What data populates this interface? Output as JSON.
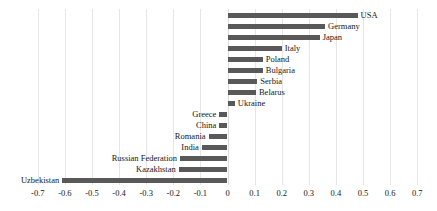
{
  "chart_data": {
    "type": "bar",
    "orientation": "horizontal",
    "title": "",
    "xlabel": "",
    "ylabel": "",
    "xlim": [
      -0.7,
      0.7
    ],
    "xticks": [
      "-0.7",
      "-0.6",
      "-0.5",
      "-0.4",
      "-0.3",
      "-0.2",
      "-0.1",
      "0",
      "0.1",
      "0.2",
      "0.3",
      "0.4",
      "0.5",
      "0.6",
      "0.7"
    ],
    "xtick_values": [
      -0.7,
      -0.6,
      -0.5,
      -0.4,
      -0.3,
      -0.2,
      -0.1,
      0,
      0.1,
      0.2,
      0.3,
      0.4,
      0.5,
      0.6,
      0.7
    ],
    "grid": true,
    "legend": "none",
    "bar_color": "#595959",
    "categories": [
      "USA",
      "Germany",
      "Japan",
      "Italy",
      "Poland",
      "Bulgaria",
      "Serbia",
      "Belarus",
      "Ukraine",
      "Greece",
      "China",
      "Romania",
      "India",
      "Russian Federation",
      "Kazakhstan",
      "Uzbekistan"
    ],
    "values": [
      0.48,
      0.36,
      0.34,
      0.2,
      0.13,
      0.13,
      0.11,
      0.105,
      0.027,
      -0.03,
      -0.03,
      -0.07,
      -0.095,
      -0.175,
      -0.18,
      -0.61
    ],
    "bars": [
      {
        "label": "USA",
        "value": 0.48
      },
      {
        "label": "Germany",
        "value": 0.36
      },
      {
        "label": "Japan",
        "value": 0.34
      },
      {
        "label": "Italy",
        "value": 0.2
      },
      {
        "label": "Poland",
        "value": 0.13
      },
      {
        "label": "Bulgaria",
        "value": 0.13
      },
      {
        "label": "Serbia",
        "value": 0.11
      },
      {
        "label": "Belarus",
        "value": 0.105
      },
      {
        "label": "Ukraine",
        "value": 0.027
      },
      {
        "label": "Greece",
        "value": -0.03
      },
      {
        "label": "China",
        "value": -0.03
      },
      {
        "label": "Romania",
        "value": -0.07
      },
      {
        "label": "India",
        "value": -0.095
      },
      {
        "label": "Russian Federation",
        "value": -0.175
      },
      {
        "label": "Kazakhstan",
        "value": -0.18
      },
      {
        "label": "Uzbekistan",
        "value": -0.61
      }
    ]
  },
  "cut_off_header": ""
}
